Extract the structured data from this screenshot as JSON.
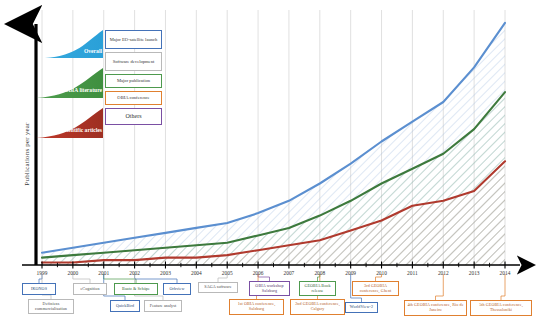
{
  "figure": {
    "ylabel": "Publications per year",
    "xlabel": "",
    "years": [
      1999,
      2000,
      2001,
      2002,
      2003,
      2004,
      2005,
      2006,
      2007,
      2008,
      2009,
      2010,
      2011,
      2012,
      2013,
      2014
    ]
  },
  "series_labels": {
    "overall": "Overall",
    "obia_literature": "OBIA literature",
    "scientific_articles": "Scientific articles"
  },
  "legend": {
    "items": [
      {
        "label": "Major EO-satellite launch",
        "color": "#4472b8",
        "key": "satellite"
      },
      {
        "label": "Software development",
        "color": "#b9b9b9",
        "key": "software"
      },
      {
        "label": "Major publication",
        "color": "#4e9a4e",
        "key": "publication"
      },
      {
        "label": "OBIA conference",
        "color": "#e08030",
        "key": "conference"
      },
      {
        "label": "Others",
        "color": "#7a4fa3",
        "key": "others"
      }
    ]
  },
  "annotations": [
    {
      "label": "IKONOS",
      "type": "satellite",
      "year": 1999,
      "row": 1
    },
    {
      "label": "Definiens commercialisation",
      "type": "software",
      "year": 1999,
      "row": 2
    },
    {
      "label": "eCognition",
      "type": "software",
      "year": 2000,
      "row": 1
    },
    {
      "label": "Baatz & Schäpe",
      "type": "publication",
      "year": 2001,
      "row": 1
    },
    {
      "label": "Orbview",
      "type": "satellite",
      "year": 2002,
      "row": 1
    },
    {
      "label": "QuickBird",
      "type": "satellite",
      "year": 2001,
      "row": 2
    },
    {
      "label": "Feature analyst",
      "type": "software",
      "year": 2002,
      "row": 2
    },
    {
      "label": "SAGA software",
      "type": "software",
      "year": 2005,
      "row": 1
    },
    {
      "label": "OBIA workshop Salzburg",
      "type": "others",
      "year": 2006,
      "row": 1
    },
    {
      "label": "GEOBIA Book release",
      "type": "publication",
      "year": 2008,
      "row": 1
    },
    {
      "label": "1st OBIA conference, Salzburg",
      "type": "conference",
      "year": 2006,
      "row": 2
    },
    {
      "label": "2nd GEOBIA conference, Calgary",
      "type": "conference",
      "year": 2008,
      "row": 2
    },
    {
      "label": "3rd GEOBIA conference, Ghent",
      "type": "conference",
      "year": 2010,
      "row": 1
    },
    {
      "label": "WorldView-2",
      "type": "satellite",
      "year": 2009,
      "row": 2
    },
    {
      "label": "4th GEOBIA conference, Rio de Janeiro",
      "type": "conference",
      "year": 2012,
      "row": 2
    },
    {
      "label": "5th GEOBIA conference, Thessaloniki",
      "type": "conference",
      "year": 2014,
      "row": 2
    }
  ],
  "chart_data": {
    "type": "area",
    "title": "",
    "xlabel": "",
    "ylabel": "Publications per year",
    "x": [
      1999,
      2000,
      2001,
      2002,
      2003,
      2004,
      2005,
      2006,
      2007,
      2008,
      2009,
      2010,
      2011,
      2012,
      2013,
      2014
    ],
    "xlim": [
      1999,
      2014
    ],
    "ylim": [
      0,
      100
    ],
    "grid": "vertical",
    "legend_position": "upper-left",
    "series": [
      {
        "name": "Overall",
        "color": "#5b8fd0",
        "values": [
          5,
          7,
          9,
          11,
          13,
          15,
          17,
          21,
          26,
          33,
          41,
          50,
          58,
          66,
          80,
          98
        ]
      },
      {
        "name": "OBIA literature",
        "color": "#3d7a3d",
        "values": [
          3,
          4,
          5,
          6,
          7,
          8,
          9,
          12,
          15,
          20,
          26,
          33,
          39,
          45,
          55,
          70
        ]
      },
      {
        "name": "Scientific articles",
        "color": "#b03a2e",
        "values": [
          1,
          1,
          2,
          2,
          3,
          3,
          4,
          6,
          8,
          10,
          14,
          18,
          24,
          26,
          30,
          42
        ]
      }
    ]
  }
}
